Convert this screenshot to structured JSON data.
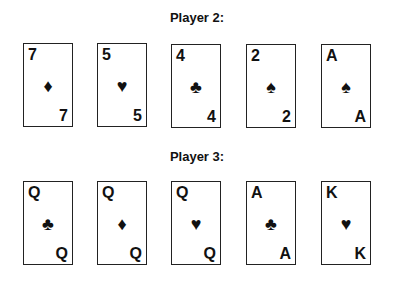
{
  "players": [
    {
      "title": "Player 2:",
      "cards": [
        {
          "rank": "7",
          "suit": "diamonds",
          "symbol": "♦"
        },
        {
          "rank": "5",
          "suit": "hearts",
          "symbol": "♥"
        },
        {
          "rank": "4",
          "suit": "clubs",
          "symbol": "♣"
        },
        {
          "rank": "2",
          "suit": "spades",
          "symbol": "♠"
        },
        {
          "rank": "A",
          "suit": "spades",
          "symbol": "♠"
        }
      ]
    },
    {
      "title": "Player 3:",
      "cards": [
        {
          "rank": "Q",
          "suit": "clubs",
          "symbol": "♣"
        },
        {
          "rank": "Q",
          "suit": "diamonds",
          "symbol": "♦"
        },
        {
          "rank": "Q",
          "suit": "hearts",
          "symbol": "♥"
        },
        {
          "rank": "A",
          "suit": "clubs",
          "symbol": "♣"
        },
        {
          "rank": "K",
          "suit": "hearts",
          "symbol": "♥"
        }
      ]
    }
  ]
}
